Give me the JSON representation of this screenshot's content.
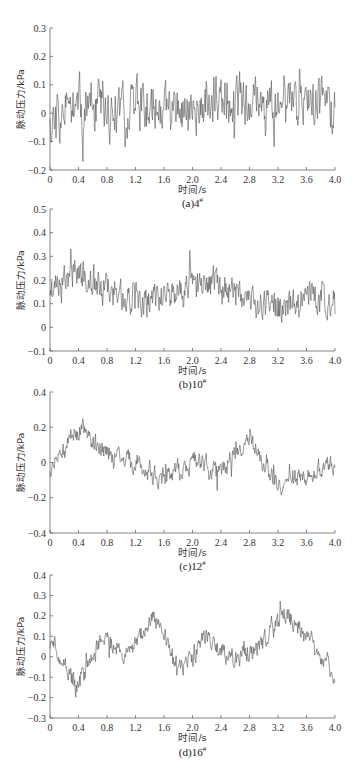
{
  "chart_data": [
    {
      "type": "line",
      "caption": "(a)4",
      "caption_sup": "#",
      "xlabel": "时间/s",
      "ylabel": "脉动压力/kPa",
      "xlim": [
        0,
        4.0
      ],
      "ylim": [
        -0.2,
        0.3
      ],
      "xticks": [
        "0",
        "0.4",
        "0.8",
        "1.2",
        "1.6",
        "2.0",
        "2.4",
        "2.8",
        "3.2",
        "3.6",
        "4.0"
      ],
      "yticks": [
        "-0.2",
        "-0.1",
        "0",
        "0.1",
        "0.2",
        "0.3"
      ],
      "series": [
        {
          "name": "4#",
          "mean": 0.03,
          "amplitude": 0.09,
          "trend": [
            0.0,
            0.02,
            0.0,
            0.03,
            0.01,
            0.0,
            0.06,
            0.04,
            0.02,
            0.05,
            0.0
          ],
          "min": -0.17,
          "max": 0.21,
          "seed": 11
        }
      ],
      "grid": false
    },
    {
      "type": "line",
      "caption": "(b)10",
      "caption_sup": "#",
      "xlabel": "时间/s",
      "ylabel": "脉动压力/kPa",
      "xlim": [
        0,
        4.0
      ],
      "ylim": [
        -0.1,
        0.5
      ],
      "xticks": [
        "0",
        "0.4",
        "0.8",
        "1.2",
        "1.6",
        "2.0",
        "2.4",
        "2.8",
        "3.2",
        "3.6",
        "4.0"
      ],
      "yticks": [
        "-0.1",
        "0",
        "0.1",
        "0.2",
        "0.3",
        "0.4",
        "0.5"
      ],
      "series": [
        {
          "name": "10#",
          "mean": 0.15,
          "amplitude": 0.07,
          "trend": [
            0.17,
            0.24,
            0.16,
            0.11,
            0.13,
            0.17,
            0.18,
            0.12,
            0.1,
            0.15,
            0.08
          ],
          "min": -0.07,
          "max": 0.42,
          "seed": 23
        }
      ],
      "grid": false
    },
    {
      "type": "line",
      "caption": "(c)12",
      "caption_sup": "#",
      "xlabel": "时间/s",
      "ylabel": "脉动压力/kPa",
      "xlim": [
        0,
        4.0
      ],
      "ylim": [
        -0.4,
        0.4
      ],
      "xticks": [
        "0",
        "0.4",
        "0.8",
        "1.2",
        "1.6",
        "2.0",
        "2.4",
        "2.8",
        "3.2",
        "3.6",
        "4.0"
      ],
      "yticks": [
        "-0.4",
        "-0.2",
        "0",
        "0.2",
        "0.4"
      ],
      "series": [
        {
          "name": "12#",
          "mean": 0.0,
          "amplitude": 0.06,
          "trend": [
            -0.05,
            0.2,
            0.05,
            0.0,
            -0.1,
            0.0,
            -0.05,
            0.15,
            -0.15,
            -0.05,
            0.0
          ],
          "min": -0.28,
          "max": 0.4,
          "seed": 37
        }
      ],
      "grid": false
    },
    {
      "type": "line",
      "caption": "(d)16",
      "caption_sup": "#",
      "xlabel": "时间/s",
      "ylabel": "脉动压力/kPa",
      "xlim": [
        0,
        4.0
      ],
      "ylim": [
        -0.3,
        0.4
      ],
      "xticks": [
        "0",
        "0.4",
        "0.8",
        "1.2",
        "1.6",
        "2.0",
        "2.4",
        "2.8",
        "3.2",
        "3.6",
        "4.0"
      ],
      "yticks": [
        "-0.3",
        "-0.2",
        "-0.1",
        "0",
        "0.1",
        "0.2",
        "0.3",
        "0.4"
      ],
      "series": [
        {
          "name": "16#",
          "mean": 0.02,
          "amplitude": 0.05,
          "trend": [
            0.1,
            -0.15,
            0.1,
            0.0,
            0.2,
            -0.08,
            0.1,
            -0.02,
            0.05,
            0.2,
            0.08,
            -0.1
          ],
          "min": -0.26,
          "max": 0.33,
          "seed": 51
        }
      ],
      "grid": false
    }
  ]
}
